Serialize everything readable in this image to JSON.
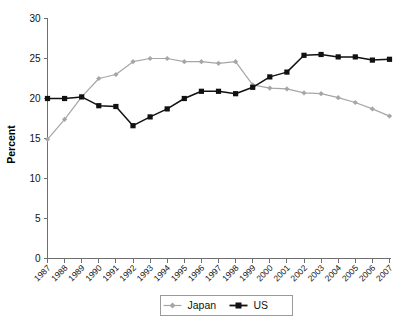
{
  "chart_data": {
    "type": "line",
    "title": "",
    "subtitle": "",
    "xlabel": "",
    "ylabel": "Percent",
    "ylim": [
      0,
      30
    ],
    "yticks": [
      0,
      5,
      10,
      15,
      20,
      25,
      30
    ],
    "grid": false,
    "legend_position": "bottom",
    "categories": [
      "1987",
      "1988",
      "1989",
      "1990",
      "1991",
      "1992",
      "1993",
      "1994",
      "1995",
      "1996",
      "1997",
      "1998",
      "1999",
      "2000",
      "2001",
      "2002",
      "2003",
      "2004",
      "2005",
      "2006",
      "2007"
    ],
    "series": [
      {
        "name": "Japan",
        "color": "#a6a6a6",
        "marker": "diamond",
        "values": [
          14.9,
          17.4,
          20.2,
          22.5,
          23.0,
          24.6,
          25.0,
          25.0,
          24.6,
          24.6,
          24.4,
          24.6,
          21.7,
          21.3,
          21.2,
          20.7,
          20.6,
          20.1,
          19.5,
          18.7,
          17.8
        ]
      },
      {
        "name": "US",
        "color": "#111111",
        "marker": "square",
        "values": [
          20.0,
          20.0,
          20.2,
          19.1,
          19.0,
          16.6,
          17.7,
          18.7,
          20.0,
          20.9,
          20.9,
          20.6,
          21.4,
          22.7,
          23.3,
          25.4,
          25.5,
          25.2,
          25.2,
          24.8,
          24.9
        ]
      }
    ]
  },
  "legend": {
    "items": [
      {
        "label": "Japan",
        "color": "#a6a6a6",
        "marker": "diamond"
      },
      {
        "label": "US",
        "color": "#111111",
        "marker": "square"
      }
    ]
  },
  "axes": {
    "y_title": "Percent"
  }
}
